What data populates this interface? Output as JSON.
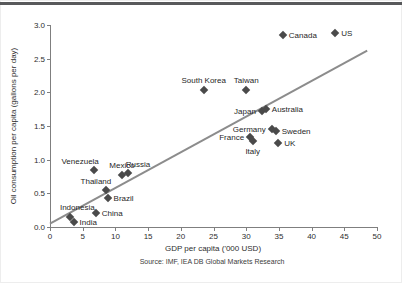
{
  "page": {
    "background": "#ffffff",
    "top_bar_color": "#58595b",
    "axis_color": "#7f7f7f",
    "text_color": "#2e2e2e"
  },
  "chart_data": {
    "type": "scatter",
    "title": "",
    "xlabel": "GDP per capita ('000 USD)",
    "ylabel": "Oil consumption per capita (gallons per day)",
    "source": "Source: IMF, IEA DB Global Markets Research",
    "xlim": [
      0,
      50
    ],
    "ylim": [
      0,
      3
    ],
    "xticks": [
      "0",
      "5",
      "10",
      "15",
      "20",
      "25",
      "30",
      "35",
      "40",
      "45",
      "50"
    ],
    "yticks": [
      "0.0",
      "0.5",
      "1.0",
      "1.5",
      "2.0",
      "2.5",
      "3.0"
    ],
    "grid": false,
    "legend": false,
    "marker_shape": "diamond",
    "marker_color": "#4a4a4a",
    "trendline": {
      "x1": 0,
      "y1": 0.05,
      "x2": 48.5,
      "y2": 2.62,
      "color": "#8c8c8c",
      "width": 2
    },
    "points": [
      {
        "label": "Canada",
        "x": 35.6,
        "y": 2.85,
        "label_pos": "right"
      },
      {
        "label": "US",
        "x": 43.6,
        "y": 2.88,
        "label_pos": "right"
      },
      {
        "label": "South Korea",
        "x": 23.5,
        "y": 2.04,
        "label_pos": "above"
      },
      {
        "label": "Taiwan",
        "x": 30.0,
        "y": 2.04,
        "label_pos": "above"
      },
      {
        "label": "Japan",
        "x": 32.4,
        "y": 1.73,
        "label_pos": "left"
      },
      {
        "label": "Australia",
        "x": 33.0,
        "y": 1.75,
        "label_pos": "right"
      },
      {
        "label": "Germany",
        "x": 33.9,
        "y": 1.46,
        "label_pos": "left"
      },
      {
        "label": "Sweden",
        "x": 34.5,
        "y": 1.42,
        "label_pos": "right"
      },
      {
        "label": "France",
        "x": 30.6,
        "y": 1.34,
        "label_pos": "left"
      },
      {
        "label": "Italy",
        "x": 31.0,
        "y": 1.27,
        "label_pos": "below"
      },
      {
        "label": "UK",
        "x": 34.9,
        "y": 1.25,
        "label_pos": "right"
      },
      {
        "label": "Venezuela",
        "x": 6.7,
        "y": 0.84,
        "label_pos": "above-left"
      },
      {
        "label": "Mexico",
        "x": 11.0,
        "y": 0.77,
        "label_pos": "above"
      },
      {
        "label": "Russia",
        "x": 11.9,
        "y": 0.8,
        "label_pos": "above-right"
      },
      {
        "label": "Thailand",
        "x": 8.6,
        "y": 0.55,
        "label_pos": "above-left"
      },
      {
        "label": "Brazil",
        "x": 8.8,
        "y": 0.43,
        "label_pos": "right"
      },
      {
        "label": "China",
        "x": 7.0,
        "y": 0.21,
        "label_pos": "right"
      },
      {
        "label": "Indonesia",
        "x": 3.1,
        "y": 0.15,
        "label_pos": "above",
        "dx": 7,
        "dy": -3
      },
      {
        "label": "India",
        "x": 3.6,
        "y": 0.08,
        "label_pos": "right"
      }
    ]
  }
}
